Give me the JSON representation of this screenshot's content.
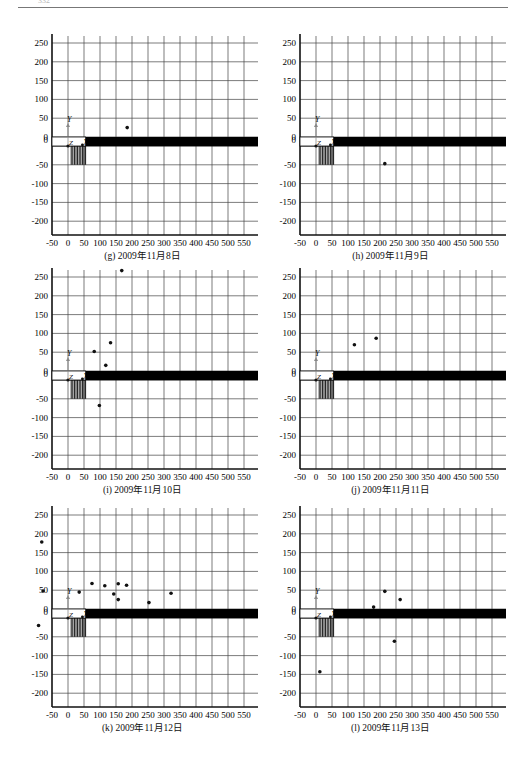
{
  "header": {
    "page_number": "332",
    "running_title": ""
  },
  "axes_common": {
    "x_ticks": [
      -50,
      0,
      50,
      100,
      150,
      200,
      250,
      300,
      350,
      400,
      450,
      500,
      550
    ],
    "x_tick_labels": [
      "-50",
      "0",
      "50",
      "100",
      "150",
      "200",
      "250",
      "300",
      "350",
      "400",
      "450",
      "500",
      "550"
    ],
    "y_ticks_upper": [
      250,
      200,
      150,
      100,
      50,
      0
    ],
    "y_ticks_lower": [
      0,
      -50,
      -100,
      -150,
      -200
    ],
    "y_tick_labels_upper": [
      "250",
      "200",
      "150",
      "100",
      "50",
      "0"
    ],
    "y_tick_labels_lower": [
      "0",
      "-50",
      "-100",
      "-150",
      "-200"
    ],
    "axis_labels": {
      "x": "X",
      "y": "Y",
      "z": "Z"
    },
    "colors": {
      "grid": "#444444",
      "axis": "#111111",
      "band": "#000000",
      "point": "#111111"
    }
  },
  "chart_data": [
    {
      "id": "g",
      "type": "scatter",
      "title": "(g) 2009年11月8日",
      "xlim": [
        -50,
        570
      ],
      "ylim": [
        -250,
        270
      ],
      "grid": true,
      "points": [
        {
          "x": 185,
          "y": 25
        }
      ]
    },
    {
      "id": "h",
      "type": "scatter",
      "title": "(h) 2009年11月9日",
      "xlim": [
        -50,
        570
      ],
      "ylim": [
        -250,
        270
      ],
      "grid": true,
      "points": [
        {
          "x": 215,
          "y": -47
        }
      ]
    },
    {
      "id": "i",
      "type": "scatter",
      "title": "(i) 2009年11月10日",
      "xlim": [
        -50,
        570
      ],
      "ylim": [
        -250,
        270
      ],
      "grid": true,
      "points": [
        {
          "x": 168,
          "y": 267
        },
        {
          "x": 133,
          "y": 75
        },
        {
          "x": 82,
          "y": 52
        },
        {
          "x": 118,
          "y": 15
        },
        {
          "x": 98,
          "y": -68
        }
      ]
    },
    {
      "id": "j",
      "type": "scatter",
      "title": "(j) 2009年11月11日",
      "xlim": [
        -50,
        570
      ],
      "ylim": [
        -250,
        270
      ],
      "grid": true,
      "points": [
        {
          "x": 120,
          "y": 70
        },
        {
          "x": 188,
          "y": 87
        }
      ]
    },
    {
      "id": "k",
      "type": "scatter",
      "title": "(k) 2009年11月12日",
      "xlim": [
        -50,
        570
      ],
      "ylim": [
        -250,
        270
      ],
      "grid": true,
      "points": [
        {
          "x": -82,
          "y": 178
        },
        {
          "x": -78,
          "y": 48
        },
        {
          "x": -92,
          "y": -20
        },
        {
          "x": 35,
          "y": 45
        },
        {
          "x": 75,
          "y": 68
        },
        {
          "x": 115,
          "y": 62
        },
        {
          "x": 143,
          "y": 40
        },
        {
          "x": 157,
          "y": 67
        },
        {
          "x": 157,
          "y": 25
        },
        {
          "x": 183,
          "y": 63
        },
        {
          "x": 253,
          "y": 17
        },
        {
          "x": 322,
          "y": 42
        }
      ]
    },
    {
      "id": "l",
      "type": "scatter",
      "title": "(l) 2009年11月13日",
      "xlim": [
        -50,
        570
      ],
      "ylim": [
        -250,
        270
      ],
      "grid": true,
      "points": [
        {
          "x": 180,
          "y": 5
        },
        {
          "x": 215,
          "y": 47
        },
        {
          "x": 263,
          "y": 25
        },
        {
          "x": 245,
          "y": -62
        },
        {
          "x": 12,
          "y": -143
        }
      ]
    }
  ]
}
